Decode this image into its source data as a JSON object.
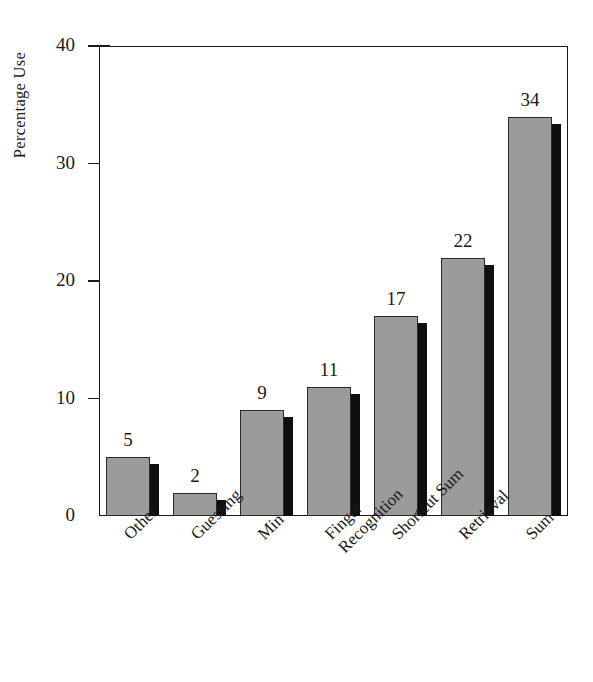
{
  "chart_data": {
    "type": "bar",
    "title": "",
    "subtitle": "",
    "xlabel": "",
    "ylabel": "Percentage Use",
    "ylim": [
      0,
      40
    ],
    "ytick_values": [
      0,
      10,
      20,
      30,
      40
    ],
    "ytick_labels": [
      "0",
      "10",
      "20",
      "30",
      "40"
    ],
    "grid": false,
    "legend": null,
    "legend_position": "none",
    "categories": [
      "Other",
      "Guessing",
      "Min",
      "Finger Recognition",
      "Shortcut Sum",
      "Retrieval",
      "Sum"
    ],
    "category_lines": [
      [
        "Other"
      ],
      [
        "Guessing"
      ],
      [
        "Min"
      ],
      [
        "Finger",
        "Recognition"
      ],
      [
        "Shortcut Sum"
      ],
      [
        "Retrieval"
      ],
      [
        "Sum"
      ]
    ],
    "values": [
      5,
      2,
      9,
      11,
      17,
      22,
      34
    ],
    "value_labels": [
      "5",
      "2",
      "9",
      "11",
      "17",
      "22",
      "34"
    ],
    "bar_style": {
      "face_color": "#9b9b9b",
      "edge_color": "#2b2b2b",
      "shadow_color": "#100f0f",
      "three_d": true
    },
    "axis_color": "#1a1a1a",
    "background_color": "#ffffff"
  },
  "yticks": [
    {
      "label": "40",
      "value": 40
    },
    {
      "label": "30",
      "value": 30
    },
    {
      "label": "20",
      "value": 20
    },
    {
      "label": "10",
      "value": 10
    },
    {
      "label": "0",
      "value": 0
    }
  ],
  "bars": [
    {
      "label": "Other",
      "line1": "Other",
      "line2": "",
      "value": 5,
      "value_label": "5"
    },
    {
      "label": "Guessing",
      "line1": "Guessing",
      "line2": "",
      "value": 2,
      "value_label": "2"
    },
    {
      "label": "Min",
      "line1": "Min",
      "line2": "",
      "value": 9,
      "value_label": "9"
    },
    {
      "label": "Finger Recognition",
      "line1": "Finger",
      "line2": "Recognition",
      "value": 11,
      "value_label": "11"
    },
    {
      "label": "Shortcut Sum",
      "line1": "Shortcut Sum",
      "line2": "",
      "value": 17,
      "value_label": "17"
    },
    {
      "label": "Retrieval",
      "line1": "Retrieval",
      "line2": "",
      "value": 22,
      "value_label": "22"
    },
    {
      "label": "Sum",
      "line1": "Sum",
      "line2": "",
      "value": 34,
      "value_label": "34"
    }
  ],
  "axis": {
    "y_label": "Percentage Use"
  }
}
